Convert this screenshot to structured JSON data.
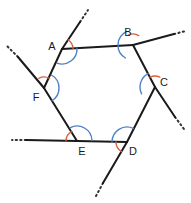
{
  "figure": {
    "type": "geometry-diagram",
    "shape_name": "hexagon",
    "colors": {
      "line": "#1a1a1a",
      "interior_arc": "#4f7fc4",
      "exterior_arc": "#d4603f",
      "background": "#ffffff",
      "label": "#1a1a1a"
    },
    "canvas": {
      "width": 191,
      "height": 203
    }
  },
  "vertices": [
    {
      "id": "A",
      "label": "A",
      "x": 62,
      "y": 49,
      "label_x": 52,
      "label_y": 47
    },
    {
      "id": "B",
      "label": "B",
      "x": 133,
      "y": 45,
      "label_x": 128,
      "label_y": 33
    },
    {
      "id": "C",
      "label": "C",
      "x": 155,
      "y": 87,
      "label_x": 164,
      "label_y": 83
    },
    {
      "id": "D",
      "label": "D",
      "x": 127,
      "y": 142,
      "label_x": 133,
      "label_y": 152
    },
    {
      "id": "E",
      "label": "E",
      "x": 77,
      "y": 141,
      "label_x": 82,
      "label_y": 152
    },
    {
      "id": "F",
      "label": "F",
      "x": 44,
      "y": 88,
      "label_x": 36,
      "label_y": 98
    }
  ],
  "edges": [
    {
      "id": "AB",
      "from": "A",
      "to": "B"
    },
    {
      "id": "BC",
      "from": "B",
      "to": "C"
    },
    {
      "id": "CD",
      "from": "C",
      "to": "D"
    },
    {
      "id": "DE",
      "from": "D",
      "to": "E"
    },
    {
      "id": "EF",
      "from": "E",
      "to": "F"
    },
    {
      "id": "FA",
      "from": "F",
      "to": "A"
    }
  ],
  "rays": [
    {
      "id": "ray-from-A-upward",
      "base": "A",
      "solid_end_x": 80,
      "solid_end_y": 22,
      "dot_end_x": 88,
      "dot_end_y": 10
    },
    {
      "id": "ray-from-B-rightward",
      "base": "B",
      "solid_end_x": 174,
      "solid_end_y": 34,
      "dot_end_x": 186,
      "dot_end_y": 31
    },
    {
      "id": "ray-from-C-downright",
      "base": "C",
      "solid_end_x": 175,
      "solid_end_y": 117,
      "dot_end_x": 184,
      "dot_end_y": 129
    },
    {
      "id": "ray-from-D-downleft",
      "base": "D",
      "solid_end_x": 103,
      "solid_end_y": 183,
      "dot_end_x": 96,
      "dot_end_y": 196
    },
    {
      "id": "ray-from-E-leftward",
      "base": "E",
      "solid_end_x": 26,
      "solid_end_y": 140,
      "dot_end_x": 12,
      "dot_end_y": 140
    },
    {
      "id": "ray-from-F-upleft",
      "base": "F",
      "solid_end_x": 18,
      "solid_end_y": 57,
      "dot_end_x": 6,
      "dot_end_y": 45
    }
  ],
  "interior_angle_arcs": [
    {
      "vertex": "A",
      "radius": 15,
      "start_deg": -3,
      "end_deg": 110
    },
    {
      "vertex": "B",
      "radius": 15,
      "start_deg": 120,
      "end_deg": 244
    },
    {
      "vertex": "C",
      "radius": 15,
      "start_deg": 153,
      "end_deg": 243
    },
    {
      "vertex": "D",
      "radius": 15,
      "start_deg": 180,
      "end_deg": 295
    },
    {
      "vertex": "E",
      "radius": 15,
      "start_deg": 242,
      "end_deg": 358
    },
    {
      "vertex": "F",
      "radius": 15,
      "start_deg": -60,
      "end_deg": 58
    }
  ],
  "exterior_angle_arcs": [
    {
      "vertex": "A",
      "radius": 11,
      "start_deg": -57,
      "end_deg": -3
    },
    {
      "vertex": "B",
      "radius": 11,
      "start_deg": 244,
      "end_deg": 301
    },
    {
      "vertex": "C",
      "radius": 11,
      "start_deg": 243,
      "end_deg": 296
    },
    {
      "vertex": "D",
      "radius": 11,
      "start_deg": 120,
      "end_deg": 180
    },
    {
      "vertex": "E",
      "radius": 11,
      "start_deg": 180,
      "end_deg": 242
    },
    {
      "vertex": "F",
      "radius": 11,
      "start_deg": -118,
      "end_deg": -60
    }
  ],
  "labels": {
    "A": "A",
    "B": "B",
    "C": "C",
    "D": "D",
    "E": "E",
    "F": "F"
  }
}
